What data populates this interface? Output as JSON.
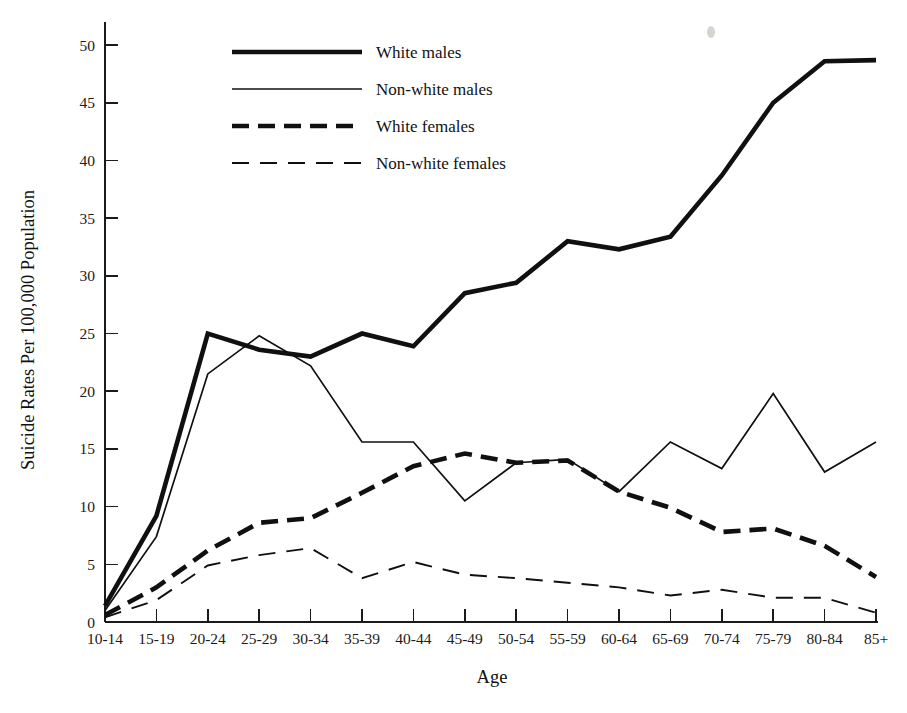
{
  "chart_data": {
    "type": "line",
    "title": "",
    "xlabel": "Age",
    "ylabel": "Suicide Rates Per 100,000 Population",
    "categories": [
      "10-14",
      "15-19",
      "20-24",
      "25-29",
      "30-34",
      "35-39",
      "40-44",
      "45-49",
      "50-54",
      "55-59",
      "60-64",
      "65-69",
      "70-74",
      "75-79",
      "80-84",
      "85+"
    ],
    "ylim": [
      0,
      52
    ],
    "yticks": [
      0,
      5,
      10,
      15,
      20,
      25,
      30,
      35,
      40,
      45,
      50
    ],
    "ytick_labels": [
      "0",
      "5",
      "10",
      "15",
      "20",
      "25",
      "30",
      "35",
      "40",
      "45",
      "50"
    ],
    "grid": false,
    "legend_position": "upper-left-inside",
    "series": [
      {
        "name": "White males",
        "style": "solid-thick",
        "stroke_width": 4.6,
        "dash": "none",
        "values": [
          1.4,
          9.2,
          25.0,
          23.6,
          23.0,
          25.0,
          23.9,
          28.5,
          29.4,
          33.0,
          32.3,
          33.4,
          38.7,
          45.0,
          48.6,
          48.7
        ]
      },
      {
        "name": "Non-white males",
        "style": "solid-thin",
        "stroke_width": 1.7,
        "dash": "none",
        "values": [
          1.0,
          7.4,
          21.5,
          24.8,
          22.2,
          15.6,
          15.6,
          10.5,
          13.8,
          14.1,
          11.3,
          15.6,
          13.3,
          19.8,
          13.0,
          15.6
        ]
      },
      {
        "name": "White females",
        "style": "dashed-thick",
        "stroke_width": 4.6,
        "dash": "17 9",
        "values": [
          0.6,
          3.0,
          6.2,
          8.6,
          9.0,
          11.2,
          13.5,
          14.6,
          13.8,
          14.0,
          11.3,
          9.9,
          7.8,
          8.1,
          6.6,
          3.9
        ]
      },
      {
        "name": "Non-white females",
        "style": "dashed-thin",
        "stroke_width": 1.9,
        "dash": "17 11",
        "values": [
          0.4,
          1.9,
          4.9,
          5.8,
          6.4,
          3.8,
          5.2,
          4.1,
          3.8,
          3.4,
          3.0,
          2.3,
          2.8,
          2.1,
          2.1,
          0.8
        ]
      }
    ]
  },
  "legend": {
    "items": [
      {
        "label": "White males"
      },
      {
        "label": "Non-white males"
      },
      {
        "label": "White females"
      },
      {
        "label": "Non-white females"
      }
    ]
  },
  "axes": {
    "y_axis_title": "Suicide Rates Per 100,000 Population",
    "x_axis_title": "Age"
  }
}
